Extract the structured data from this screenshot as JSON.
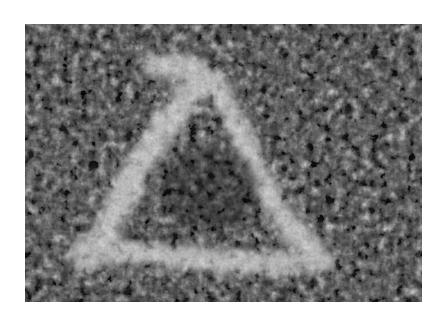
{
  "image": {
    "description": "Grayscale noisy micrograph showing a bright triangular ring-shaped structure",
    "colors": {
      "background": "#ffffff",
      "dark_texture": "#1e1e1e",
      "mid_texture": "#6a6a6a",
      "bright_feature": "#e8e8e8"
    },
    "feature": {
      "shape": "triangle-outline",
      "apex": [
        165,
        42
      ],
      "left_corner": [
        55,
        226
      ],
      "right_corner": [
        295,
        236
      ]
    }
  }
}
